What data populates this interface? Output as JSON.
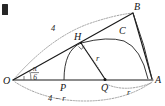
{
  "figure": {
    "points": [
      {
        "id": "O",
        "label": "O",
        "x": 13,
        "y": 80
      },
      {
        "id": "A",
        "label": "A",
        "x": 153,
        "y": 80
      },
      {
        "id": "B",
        "label": "B",
        "x": 133,
        "y": 13
      },
      {
        "id": "H",
        "label": "H",
        "x": 80,
        "y": 42
      },
      {
        "id": "C",
        "label": "C",
        "x": 122,
        "y": 36
      },
      {
        "id": "P",
        "label": "P",
        "x": 64,
        "y": 80
      },
      {
        "id": "Q",
        "label": "Q",
        "x": 105,
        "y": 80
      }
    ],
    "length_labels": [
      {
        "id": "radius-OB",
        "text": "4"
      },
      {
        "id": "hypotenuse-OQ",
        "text": "4 − r"
      },
      {
        "id": "radius-QA",
        "text": "r"
      },
      {
        "id": "radius-QH",
        "text": "r"
      }
    ],
    "angle_label": {
      "id": "angle-AOB",
      "numerator": "π",
      "denominator": "6"
    },
    "colors": {
      "stroke_solid": "#1a1a1a",
      "stroke_dotted": "#8a8a8a",
      "label_text": "#141414",
      "background": "#ffffff"
    }
  }
}
